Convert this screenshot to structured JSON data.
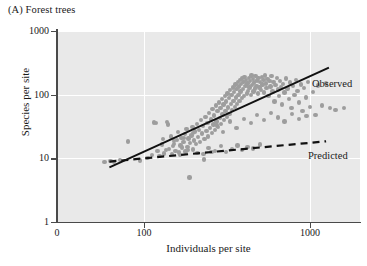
{
  "panel": {
    "label": "(A) Forest trees"
  },
  "chart_data": {
    "type": "scatter",
    "title": "(A) Forest trees",
    "xlabel": "Individuals per site",
    "ylabel": "Species per site",
    "xscale": "log",
    "yscale": "log",
    "xlim": [
      30,
      2000
    ],
    "ylim": [
      1,
      1000
    ],
    "xticks": [
      0,
      100,
      1000
    ],
    "xticklabels": [
      "0",
      "100",
      "1000"
    ],
    "yticks": [
      1,
      10,
      100,
      1000
    ],
    "yticklabels": [
      "1",
      "10",
      "100",
      "1000"
    ],
    "grid": true,
    "grid_color": "#ffffff",
    "plot_background": "#e9e9e9",
    "point_color": "#9d9d9d",
    "legend_position": "inline-right",
    "series": [
      {
        "name": "Observed",
        "label": "Observed",
        "type": "line",
        "style": "solid",
        "color": "#111111",
        "x": [
          62,
          1300
        ],
        "y": [
          7.2,
          265
        ]
      },
      {
        "name": "Predicted",
        "label": "Predicted",
        "type": "line",
        "style": "dashed",
        "color": "#111111",
        "x": [
          62,
          1250
        ],
        "y": [
          8.9,
          18.5
        ]
      }
    ],
    "points": [
      [
        58,
        8.7
      ],
      [
        63,
        9.0
      ],
      [
        66,
        8.8
      ],
      [
        72,
        9.4
      ],
      [
        80,
        18.5
      ],
      [
        95,
        9.2
      ],
      [
        105,
        10.2
      ],
      [
        112,
        11.4
      ],
      [
        118,
        36.0
      ],
      [
        121,
        13.0
      ],
      [
        124,
        10.9
      ],
      [
        128,
        16.5
      ],
      [
        130,
        20.0
      ],
      [
        132,
        12.0
      ],
      [
        136,
        13.5
      ],
      [
        140,
        34.0
      ],
      [
        142,
        14.0
      ],
      [
        145,
        22.0
      ],
      [
        148,
        11.6
      ],
      [
        150,
        15.8
      ],
      [
        152,
        17.0
      ],
      [
        155,
        13.2
      ],
      [
        158,
        19.5
      ],
      [
        160,
        26.0
      ],
      [
        163,
        12.4
      ],
      [
        166,
        16.0
      ],
      [
        168,
        21.0
      ],
      [
        170,
        14.8
      ],
      [
        173,
        18.0
      ],
      [
        176,
        24.0
      ],
      [
        178,
        12.8
      ],
      [
        180,
        29.0
      ],
      [
        183,
        15.0
      ],
      [
        186,
        20.5
      ],
      [
        188,
        5.0
      ],
      [
        190,
        17.5
      ],
      [
        193,
        23.0
      ],
      [
        196,
        31.0
      ],
      [
        198,
        13.8
      ],
      [
        200,
        19.0
      ],
      [
        203,
        26.5
      ],
      [
        206,
        16.8
      ],
      [
        209,
        35.0
      ],
      [
        212,
        21.5
      ],
      [
        215,
        28.0
      ],
      [
        218,
        18.2
      ],
      [
        221,
        40.0
      ],
      [
        224,
        24.5
      ],
      [
        227,
        32.0
      ],
      [
        230,
        9.6
      ],
      [
        232,
        20.0
      ],
      [
        235,
        45.0
      ],
      [
        238,
        27.0
      ],
      [
        241,
        36.0
      ],
      [
        244,
        22.0
      ],
      [
        247,
        52.0
      ],
      [
        250,
        30.0
      ],
      [
        253,
        41.0
      ],
      [
        256,
        25.0
      ],
      [
        259,
        60.0
      ],
      [
        262,
        34.0
      ],
      [
        265,
        47.0
      ],
      [
        268,
        28.0
      ],
      [
        271,
        68.0
      ],
      [
        274,
        38.0
      ],
      [
        277,
        55.0
      ],
      [
        280,
        31.0
      ],
      [
        283,
        75.0
      ],
      [
        286,
        43.0
      ],
      [
        289,
        62.0
      ],
      [
        292,
        35.0
      ],
      [
        295,
        85.0
      ],
      [
        298,
        49.0
      ],
      [
        301,
        70.0
      ],
      [
        304,
        40.0
      ],
      [
        307,
        95.0
      ],
      [
        310,
        56.0
      ],
      [
        313,
        78.0
      ],
      [
        316,
        45.0
      ],
      [
        319,
        105.0
      ],
      [
        322,
        63.0
      ],
      [
        325,
        88.0
      ],
      [
        328,
        50.0
      ],
      [
        331,
        118.0
      ],
      [
        334,
        71.0
      ],
      [
        337,
        98.0
      ],
      [
        340,
        57.0
      ],
      [
        343,
        130.0
      ],
      [
        346,
        80.0
      ],
      [
        349,
        110.0
      ],
      [
        352,
        64.0
      ],
      [
        355,
        145.0
      ],
      [
        358,
        90.0
      ],
      [
        361,
        122.0
      ],
      [
        364,
        72.0
      ],
      [
        367,
        158.0
      ],
      [
        370,
        100.0
      ],
      [
        373,
        135.0
      ],
      [
        376,
        80.0
      ],
      [
        379,
        170.0
      ],
      [
        382,
        112.0
      ],
      [
        385,
        148.0
      ],
      [
        388,
        88.0
      ],
      [
        391,
        180.0
      ],
      [
        394,
        124.0
      ],
      [
        397,
        160.0
      ],
      [
        400,
        96.0
      ],
      [
        404,
        190.0
      ],
      [
        408,
        136.0
      ],
      [
        412,
        172.0
      ],
      [
        416,
        104.0
      ],
      [
        420,
        150.0
      ],
      [
        424,
        115.0
      ],
      [
        428,
        185.0
      ],
      [
        432,
        130.0
      ],
      [
        436,
        165.0
      ],
      [
        440,
        100.0
      ],
      [
        444,
        200.0
      ],
      [
        448,
        142.0
      ],
      [
        452,
        178.0
      ],
      [
        456,
        112.0
      ],
      [
        460,
        155.0
      ],
      [
        465,
        125.0
      ],
      [
        470,
        195.0
      ],
      [
        475,
        138.0
      ],
      [
        480,
        168.0
      ],
      [
        485,
        105.0
      ],
      [
        490,
        182.0
      ],
      [
        495,
        130.0
      ],
      [
        500,
        160.0
      ],
      [
        506,
        118.0
      ],
      [
        512,
        190.0
      ],
      [
        518,
        145.0
      ],
      [
        524,
        172.0
      ],
      [
        530,
        108.0
      ],
      [
        536,
        200.0
      ],
      [
        542,
        150.0
      ],
      [
        548,
        128.0
      ],
      [
        555,
        178.0
      ],
      [
        562,
        96.0
      ],
      [
        570,
        165.0
      ],
      [
        578,
        135.0
      ],
      [
        586,
        195.0
      ],
      [
        594,
        112.0
      ],
      [
        602,
        158.0
      ],
      [
        610,
        78.0
      ],
      [
        620,
        142.0
      ],
      [
        630,
        185.0
      ],
      [
        640,
        120.0
      ],
      [
        650,
        95.0
      ],
      [
        660,
        165.0
      ],
      [
        670,
        132.0
      ],
      [
        680,
        70.0
      ],
      [
        690,
        148.0
      ],
      [
        700,
        108.0
      ],
      [
        715,
        180.0
      ],
      [
        730,
        125.0
      ],
      [
        745,
        85.0
      ],
      [
        760,
        155.0
      ],
      [
        775,
        62.0
      ],
      [
        790,
        138.0
      ],
      [
        805,
        100.0
      ],
      [
        820,
        170.0
      ],
      [
        840,
        115.0
      ],
      [
        860,
        75.0
      ],
      [
        880,
        145.0
      ],
      [
        900,
        55.0
      ],
      [
        920,
        128.0
      ],
      [
        945,
        90.0
      ],
      [
        970,
        160.0
      ],
      [
        1000,
        64.0
      ],
      [
        1040,
        110.0
      ],
      [
        1080,
        48.0
      ],
      [
        1120,
        140.0
      ],
      [
        1180,
        68.0
      ],
      [
        1250,
        150.0
      ],
      [
        1320,
        62.0
      ],
      [
        1420,
        58.0
      ],
      [
        1600,
        62.0
      ],
      [
        245,
        14.5
      ],
      [
        268,
        13.0
      ],
      [
        290,
        15.5
      ],
      [
        312,
        12.5
      ],
      [
        340,
        14.0
      ],
      [
        365,
        16.0
      ],
      [
        390,
        13.5
      ],
      [
        420,
        15.0
      ],
      [
        455,
        14.2
      ],
      [
        500,
        16.5
      ],
      [
        210,
        12.2
      ],
      [
        185,
        13.6
      ],
      [
        228,
        11.8
      ],
      [
        255,
        12.6
      ],
      [
        165,
        11.2
      ],
      [
        275,
        33.0
      ],
      [
        300,
        26.0
      ],
      [
        330,
        38.0
      ],
      [
        360,
        30.0
      ],
      [
        400,
        42.0
      ],
      [
        440,
        36.0
      ],
      [
        480,
        48.0
      ],
      [
        530,
        40.0
      ],
      [
        580,
        52.0
      ],
      [
        640,
        44.0
      ],
      [
        700,
        38.0
      ],
      [
        780,
        50.0
      ],
      [
        860,
        42.0
      ],
      [
        950,
        46.0
      ],
      [
        138,
        37.0
      ],
      [
        115,
        36.5
      ],
      [
        152,
        18.8
      ],
      [
        175,
        21.0
      ],
      [
        198,
        25.0
      ]
    ]
  }
}
